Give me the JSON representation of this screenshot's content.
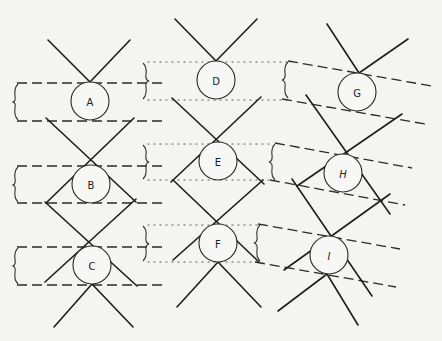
{
  "figure": {
    "type": "lattice-diagram",
    "columns": [
      {
        "name": "column-1",
        "band_style": "dashed",
        "nodes": [
          {
            "id": "A",
            "label": "A",
            "cx": 90,
            "cy": 101
          },
          {
            "id": "B",
            "label": "B",
            "cx": 91,
            "cy": 184
          },
          {
            "id": "C",
            "label": "C",
            "cx": 92,
            "cy": 265
          }
        ]
      },
      {
        "name": "column-2",
        "band_style": "dotted",
        "nodes": [
          {
            "id": "D",
            "label": "D",
            "cx": 216,
            "cy": 80
          },
          {
            "id": "E",
            "label": "E",
            "cx": 218,
            "cy": 161
          },
          {
            "id": "F",
            "label": "F",
            "cx": 218,
            "cy": 243
          }
        ]
      },
      {
        "name": "column-3",
        "band_style": "dashed-slanted",
        "nodes": [
          {
            "id": "G",
            "label": "G",
            "cx": 357,
            "cy": 92
          },
          {
            "id": "H",
            "label": "H",
            "cx": 343,
            "cy": 173
          },
          {
            "id": "I",
            "label": "I",
            "cx": 329,
            "cy": 255
          }
        ]
      }
    ],
    "node_radius": 19,
    "colors": {
      "background": "#f4f4f2",
      "line": "#1e1e1e",
      "node_fill": "#f7f7f5"
    }
  }
}
